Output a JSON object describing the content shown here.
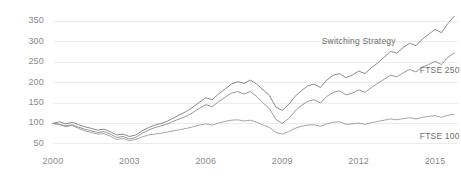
{
  "chart_data": {
    "type": "line",
    "title": "",
    "subtitle": "",
    "xlabel": "",
    "ylabel": "",
    "xlim": [
      2000,
      2015.9
    ],
    "ylim": [
      40,
      370
    ],
    "grid": true,
    "grid_axis": "y",
    "legend_position": "inline-right",
    "xticks": [
      "2000",
      "2003",
      "2006",
      "2009",
      "2012",
      "2015"
    ],
    "xtick_values": [
      2000,
      2003,
      2006,
      2009,
      2012,
      2015
    ],
    "yticks": [
      "50",
      "100",
      "150",
      "200",
      "250",
      "300",
      "350"
    ],
    "ytick_values": [
      50,
      100,
      150,
      200,
      250,
      300,
      350
    ],
    "series": [
      {
        "name": "Switching Strategy",
        "color": "#6b6b6b",
        "label_x": 2010.55,
        "label_y": 300,
        "x": [
          2000.0,
          2000.25,
          2000.5,
          2000.75,
          2001.0,
          2001.25,
          2001.5,
          2001.75,
          2002.0,
          2002.25,
          2002.5,
          2002.75,
          2003.0,
          2003.25,
          2003.5,
          2003.75,
          2004.0,
          2004.25,
          2004.5,
          2004.75,
          2005.0,
          2005.25,
          2005.5,
          2005.75,
          2006.0,
          2006.25,
          2006.5,
          2006.75,
          2007.0,
          2007.25,
          2007.5,
          2007.75,
          2008.0,
          2008.25,
          2008.5,
          2008.75,
          2009.0,
          2009.25,
          2009.5,
          2009.75,
          2010.0,
          2010.25,
          2010.5,
          2010.75,
          2011.0,
          2011.25,
          2011.5,
          2011.75,
          2012.0,
          2012.25,
          2012.5,
          2012.75,
          2013.0,
          2013.25,
          2013.5,
          2013.75,
          2014.0,
          2014.25,
          2014.5,
          2014.75,
          2015.0,
          2015.25,
          2015.5,
          2015.75
        ],
        "values": [
          100,
          104,
          99,
          103,
          97,
          92,
          88,
          84,
          86,
          80,
          72,
          74,
          68,
          72,
          82,
          90,
          96,
          100,
          106,
          114,
          122,
          130,
          140,
          152,
          163,
          158,
          172,
          184,
          196,
          202,
          198,
          206,
          196,
          182,
          168,
          140,
          132,
          146,
          166,
          180,
          192,
          196,
          188,
          206,
          218,
          222,
          212,
          218,
          228,
          222,
          236,
          248,
          262,
          276,
          272,
          286,
          296,
          290,
          306,
          318,
          330,
          322,
          344,
          362
        ]
      },
      {
        "name": "FTSE 250",
        "color": "#7d7d7d",
        "label_x": 2014.4,
        "label_y": 228,
        "x": [
          2000.0,
          2000.25,
          2000.5,
          2000.75,
          2001.0,
          2001.25,
          2001.5,
          2001.75,
          2002.0,
          2002.25,
          2002.5,
          2002.75,
          2003.0,
          2003.25,
          2003.5,
          2003.75,
          2004.0,
          2004.25,
          2004.5,
          2004.75,
          2005.0,
          2005.25,
          2005.5,
          2005.75,
          2006.0,
          2006.25,
          2006.5,
          2006.75,
          2007.0,
          2007.25,
          2007.5,
          2007.75,
          2008.0,
          2008.25,
          2008.5,
          2008.75,
          2009.0,
          2009.25,
          2009.5,
          2009.75,
          2010.0,
          2010.25,
          2010.5,
          2010.75,
          2011.0,
          2011.25,
          2011.5,
          2011.75,
          2012.0,
          2012.25,
          2012.5,
          2012.75,
          2013.0,
          2013.25,
          2013.5,
          2013.75,
          2014.0,
          2014.25,
          2014.5,
          2014.75,
          2015.0,
          2015.25,
          2015.5,
          2015.75
        ],
        "values": [
          100,
          98,
          94,
          97,
          91,
          86,
          82,
          78,
          80,
          74,
          66,
          68,
          62,
          66,
          76,
          84,
          90,
          94,
          99,
          106,
          112,
          118,
          127,
          137,
          146,
          141,
          153,
          164,
          174,
          178,
          172,
          178,
          166,
          150,
          136,
          110,
          100,
          112,
          130,
          144,
          154,
          158,
          150,
          166,
          176,
          180,
          170,
          174,
          182,
          176,
          188,
          198,
          208,
          218,
          214,
          224,
          232,
          226,
          238,
          244,
          252,
          244,
          262,
          272
        ]
      },
      {
        "name": "FTSE 100",
        "color": "#8e8e8e",
        "label_x": 2014.4,
        "label_y": 68,
        "x": [
          2000.0,
          2000.25,
          2000.5,
          2000.75,
          2001.0,
          2001.25,
          2001.5,
          2001.75,
          2002.0,
          2002.25,
          2002.5,
          2002.75,
          2003.0,
          2003.25,
          2003.5,
          2003.75,
          2004.0,
          2004.25,
          2004.5,
          2004.75,
          2005.0,
          2005.25,
          2005.5,
          2005.75,
          2006.0,
          2006.25,
          2006.5,
          2006.75,
          2007.0,
          2007.25,
          2007.5,
          2007.75,
          2008.0,
          2008.25,
          2008.5,
          2008.75,
          2009.0,
          2009.25,
          2009.5,
          2009.75,
          2010.0,
          2010.25,
          2010.5,
          2010.75,
          2011.0,
          2011.25,
          2011.5,
          2011.75,
          2012.0,
          2012.25,
          2012.5,
          2012.75,
          2013.0,
          2013.25,
          2013.5,
          2013.75,
          2014.0,
          2014.25,
          2014.5,
          2014.75,
          2015.0,
          2015.25,
          2015.5,
          2015.75
        ],
        "values": [
          100,
          97,
          92,
          95,
          88,
          82,
          78,
          74,
          75,
          69,
          61,
          63,
          58,
          61,
          67,
          72,
          74,
          76,
          79,
          82,
          85,
          88,
          92,
          96,
          99,
          96,
          101,
          105,
          108,
          109,
          106,
          108,
          103,
          96,
          90,
          78,
          74,
          80,
          88,
          93,
          96,
          97,
          93,
          99,
          103,
          104,
          98,
          99,
          101,
          98,
          102,
          105,
          108,
          111,
          109,
          112,
          114,
          111,
          115,
          117,
          119,
          115,
          120,
          122
        ]
      }
    ]
  },
  "axis": {
    "ytick_labels": [
      "350",
      "300",
      "250",
      "200",
      "150",
      "100",
      "50"
    ],
    "xtick_labels": [
      "2000",
      "2003",
      "2006",
      "2009",
      "2012",
      "2015"
    ]
  },
  "annotations": {
    "switching_strategy_label": "Switching Strategy",
    "ftse250_label": "FTSE 250",
    "ftse100_label": "FTSE 100"
  },
  "colors": {
    "background": "#ffffff",
    "gridline": "#ececec",
    "tick_text": "#8a8a8a",
    "label_text": "#6d6d6d"
  }
}
